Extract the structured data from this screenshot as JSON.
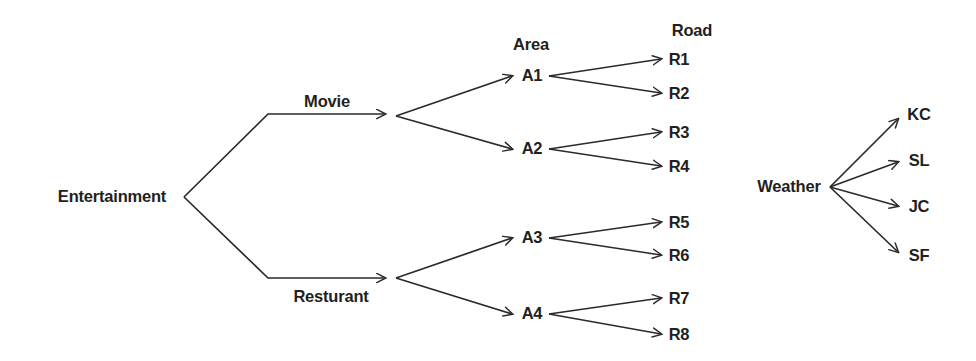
{
  "diagram": {
    "type": "tree-diagram",
    "line_color": "#2b2b2b",
    "text_color": "#231f20",
    "background": "#ffffff",
    "headers": [
      {
        "id": "area-header",
        "text": "Area",
        "x": 531,
        "y": 44
      },
      {
        "id": "road-header",
        "text": "Road",
        "x": 692,
        "y": 30
      }
    ],
    "trees": [
      {
        "id": "entertainment-tree",
        "root": {
          "id": "entertainment",
          "text": "Entertainment",
          "x": 112,
          "y": 196
        },
        "edge_labels": [
          {
            "id": "movie",
            "text": "Movie",
            "x": 327,
            "y": 101
          },
          {
            "id": "resturant",
            "text": "Resturant",
            "x": 331,
            "y": 296
          }
        ],
        "mid_nodes": [
          {
            "id": "a1",
            "text": "A1",
            "x": 532,
            "y": 75
          },
          {
            "id": "a2",
            "text": "A2",
            "x": 532,
            "y": 148
          },
          {
            "id": "a3",
            "text": "A3",
            "x": 532,
            "y": 237
          },
          {
            "id": "a4",
            "text": "A4",
            "x": 532,
            "y": 313
          }
        ],
        "leaves": [
          {
            "id": "r1",
            "text": "R1",
            "x": 679,
            "y": 59
          },
          {
            "id": "r2",
            "text": "R2",
            "x": 679,
            "y": 93
          },
          {
            "id": "r3",
            "text": "R3",
            "x": 679,
            "y": 132
          },
          {
            "id": "r4",
            "text": "R4",
            "x": 679,
            "y": 166
          },
          {
            "id": "r5",
            "text": "R5",
            "x": 679,
            "y": 222
          },
          {
            "id": "r6",
            "text": "R6",
            "x": 679,
            "y": 255
          },
          {
            "id": "r7",
            "text": "R7",
            "x": 679,
            "y": 298
          },
          {
            "id": "r8",
            "text": "R8",
            "x": 679,
            "y": 334
          }
        ]
      },
      {
        "id": "weather-tree",
        "root": {
          "id": "weather",
          "text": "Weather",
          "x": 789,
          "y": 186
        },
        "edge_labels": [],
        "mid_nodes": [],
        "leaves": [
          {
            "id": "kc",
            "text": "KC",
            "x": 919,
            "y": 114
          },
          {
            "id": "sl",
            "text": "SL",
            "x": 919,
            "y": 160
          },
          {
            "id": "jc",
            "text": "JC",
            "x": 919,
            "y": 206
          },
          {
            "id": "sf",
            "text": "SF",
            "x": 919,
            "y": 255
          }
        ]
      }
    ]
  }
}
